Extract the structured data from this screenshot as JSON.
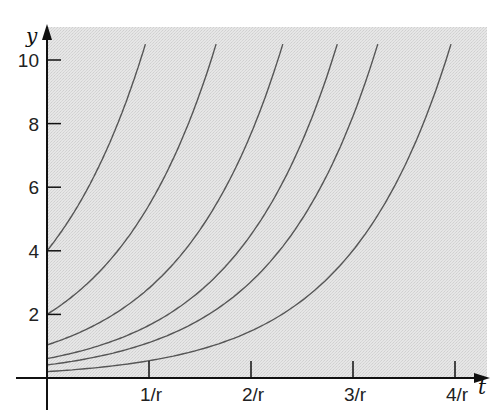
{
  "chart_data": {
    "type": "line",
    "title": "",
    "xlabel": "t",
    "ylabel": "y",
    "x_ticks": [
      "1/r",
      "2/r",
      "3/r",
      "4/r"
    ],
    "x_tick_values": [
      1,
      2,
      3,
      4
    ],
    "y_ticks": [
      "2",
      "4",
      "6",
      "8",
      "10"
    ],
    "y_tick_values": [
      2,
      4,
      6,
      8,
      10
    ],
    "xlim": [
      0,
      4.3
    ],
    "ylim": [
      0,
      10.5
    ],
    "grid": false,
    "legend": null,
    "background": "stippled light gray",
    "series": [
      {
        "name": "y0=4",
        "y0": 4.0
      },
      {
        "name": "y0=2",
        "y0": 2.0
      },
      {
        "name": "y0=1",
        "y0": 1.04
      },
      {
        "name": "y0=0.6",
        "y0": 0.61
      },
      {
        "name": "y0=0.4",
        "y0": 0.41
      },
      {
        "name": "y0=0.2",
        "y0": 0.2
      }
    ]
  },
  "colors": {
    "shade": "#e2e2e2",
    "curve": "#555555",
    "axis": "#111111"
  }
}
